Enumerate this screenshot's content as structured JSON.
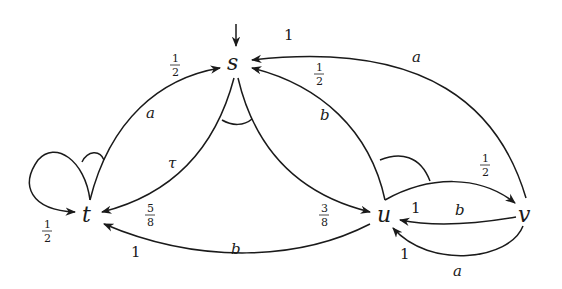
{
  "diagram": {
    "type": "probabilistic-automaton",
    "nodes": [
      {
        "id": "s",
        "label": "s",
        "initial": true
      },
      {
        "id": "t",
        "label": "t"
      },
      {
        "id": "u",
        "label": "u"
      },
      {
        "id": "v",
        "label": "v"
      }
    ],
    "edges": [
      {
        "from": "t",
        "to": "s",
        "action": "a",
        "prob": "1/2"
      },
      {
        "from": "t",
        "to": "t",
        "action": "a",
        "prob": "1/2"
      },
      {
        "from": "s",
        "to": "t",
        "action": "τ",
        "prob": "5/8"
      },
      {
        "from": "s",
        "to": "u",
        "action": "τ",
        "prob": "3/8"
      },
      {
        "from": "u",
        "to": "s",
        "action": "b",
        "prob": "1/2"
      },
      {
        "from": "u",
        "to": "v",
        "action": "b",
        "prob": "1/2"
      },
      {
        "from": "u",
        "to": "t",
        "action": "b",
        "prob": "1"
      },
      {
        "from": "v",
        "to": "s",
        "action": "a",
        "prob": "1"
      },
      {
        "from": "v",
        "to": "u",
        "action": "b",
        "prob": "1"
      },
      {
        "from": "v",
        "to": "u",
        "action": "a",
        "prob": "1"
      }
    ]
  },
  "labels": {
    "s": "s",
    "t": "t",
    "u": "u",
    "v": "v",
    "a": "a",
    "b": "b",
    "tau": "τ",
    "one": "1",
    "half_num": "1",
    "half_den": "2",
    "five": "5",
    "three": "3",
    "eight": "8"
  }
}
